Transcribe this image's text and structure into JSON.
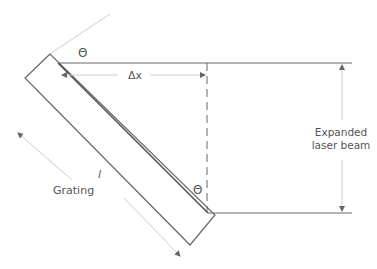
{
  "diagram": {
    "type": "optics-schematic",
    "colors": {
      "line": "#666666",
      "light_line": "#bbbbbb",
      "text": "#555555",
      "background": "#ffffff"
    },
    "labels": {
      "theta_top": "Θ",
      "theta_bottom": "Θ",
      "delta_x": "Δx",
      "length": "l",
      "grating": "Grating",
      "beam_line1": "Expanded",
      "beam_line2": "laser beam"
    }
  }
}
